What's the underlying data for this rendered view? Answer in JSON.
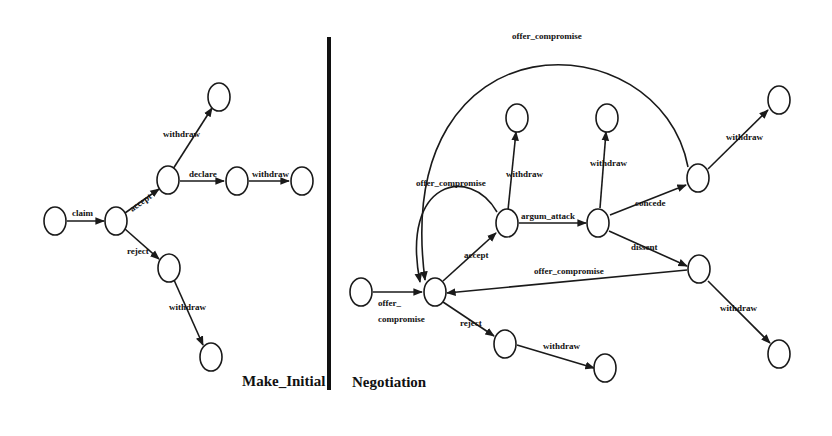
{
  "panels": {
    "make_initial": {
      "title": "Make_Initial",
      "labels": {
        "claim": "claim",
        "accept": "accept",
        "reject": "reject",
        "withdraw_top": "withdraw",
        "declare": "declare",
        "withdraw_declare": "withdraw",
        "withdraw_reject": "withdraw"
      }
    },
    "negotiation": {
      "title": "Negotiation",
      "labels": {
        "offer_line1": "offer_",
        "offer_line2": "compromise",
        "accept": "accept",
        "reject": "reject",
        "withdraw_reject": "withdraw",
        "self_loop": "offer_compromise",
        "big_arc": "offer_compromise",
        "withdraw_accept": "withdraw",
        "argum_attack": "argum_attack",
        "withdraw_argum": "withdraw",
        "concede": "concede",
        "dissent": "dissent",
        "withdraw_concede": "withdraw",
        "withdraw_dissent": "withdraw",
        "dissent_back": "offer_compromise"
      }
    }
  },
  "colors": {
    "stroke": "#1a1a1a",
    "background": "#ffffff"
  }
}
